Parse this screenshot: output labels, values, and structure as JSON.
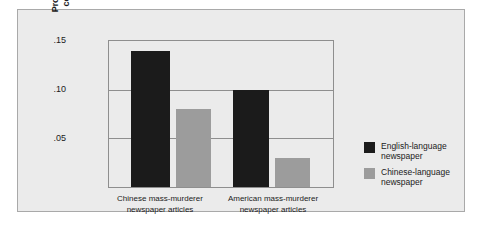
{
  "chart_data": {
    "type": "bar",
    "title": "",
    "subtitle": "",
    "xlabel": "",
    "ylabel_lines": [
      "Proportion of attributions",
      "coded as dispositional"
    ],
    "ylabel": "Proportion of attributions coded as dispositional",
    "ylim": [
      0,
      0.15
    ],
    "yticks": [
      ".05",
      ".10",
      ".15"
    ],
    "ytick_values": [
      0.05,
      0.1,
      0.15
    ],
    "grid": "horizontal",
    "legend_position": "right",
    "categories": [
      "Chinese mass-murderer newspaper articles",
      "American mass-murderer newspaper articles"
    ],
    "category_lines": [
      [
        "Chinese mass-murderer",
        "newspaper articles"
      ],
      [
        "American mass-murderer",
        "newspaper articles"
      ]
    ],
    "series": [
      {
        "name": "English-language newspaper",
        "name_lines": [
          "English-language",
          "newspaper"
        ],
        "color": "#1b1b1b",
        "values": [
          0.14,
          0.1
        ]
      },
      {
        "name": "Chinese-language newspaper",
        "name_lines": [
          "Chinese-language",
          "newspaper"
        ],
        "color": "#9c9c9c",
        "values": [
          0.08,
          0.03
        ]
      }
    ]
  },
  "colors": {
    "page_background": "#ffffff",
    "panel_background": "#ebebeb",
    "panel_border": "#a9a9a9",
    "axis": "#8e8e8e",
    "text": "#1b1b1b",
    "series_dark": "#1b1b1b",
    "series_light": "#9c9c9c"
  }
}
